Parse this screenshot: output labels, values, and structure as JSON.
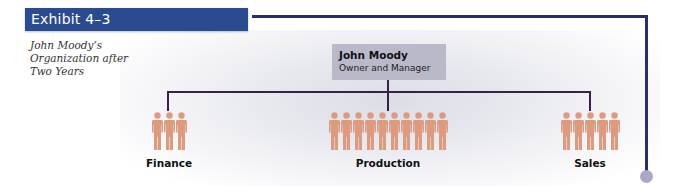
{
  "exhibit": {
    "label": "Exhibit 4–3",
    "bar_color": "#2b4b90"
  },
  "caption": {
    "lines": [
      "John Moody’s",
      "Organization after",
      "Two Years"
    ]
  },
  "manager": {
    "name": "John Moody",
    "role": "Owner and Manager",
    "box_color": "#b9b9c9"
  },
  "departments": [
    {
      "name": "Finance",
      "headcount": 3
    },
    {
      "name": "Production",
      "headcount": 10
    },
    {
      "name": "Sales",
      "headcount": 5
    }
  ],
  "colors": {
    "person": "#dc9a7e",
    "connector": "#3b1e4a",
    "frame_line": "#26306e",
    "end_dot": "#a9a9c4"
  }
}
